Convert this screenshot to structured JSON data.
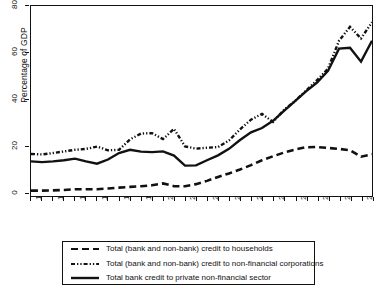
{
  "chart_data": {
    "type": "line",
    "title": "",
    "xlabel": "",
    "ylabel": "Percentage of GDP",
    "ylim": [
      0,
      80
    ],
    "yticks": [
      0,
      20,
      40,
      60,
      80
    ],
    "xlim": [
      1989,
      2020
    ],
    "grid": false,
    "legend_position": "below",
    "x": [
      1989,
      1990,
      1991,
      1992,
      1993,
      1994,
      1995,
      1996,
      1997,
      1998,
      1999,
      2000,
      2001,
      2002,
      2003,
      2004,
      2005,
      2006,
      2007,
      2008,
      2009,
      2010,
      2011,
      2012,
      2013,
      2014,
      2015,
      2016,
      2017,
      2018,
      2019,
      2020
    ],
    "xtick_labels": [
      "1989",
      "1991",
      "1993",
      "1995",
      "1997",
      "1999",
      "2001",
      "2003",
      "2005",
      "2007",
      "2009",
      "2011",
      "2013",
      "2015",
      "2017",
      "2019"
    ],
    "xtick_years": [
      1989,
      1991,
      1993,
      1995,
      1997,
      1999,
      2001,
      2003,
      2005,
      2007,
      2009,
      2011,
      2013,
      2015,
      2017,
      2019
    ],
    "series": [
      {
        "name": "Total (bank and non-bank) credit to households",
        "style": "dashed",
        "color": "#111111",
        "values": [
          0.4,
          0.4,
          0.5,
          0.7,
          1.0,
          1.0,
          1.0,
          1.3,
          1.7,
          2.0,
          2.3,
          2.7,
          3.5,
          2.3,
          2.3,
          3.2,
          4.6,
          6.3,
          7.8,
          9.5,
          11.4,
          13.5,
          15.2,
          16.8,
          18.1,
          19.1,
          19.2,
          18.8,
          18.4,
          17.8,
          15.0,
          16.1
        ]
      },
      {
        "name": "Total (bank and non-bank) credit to non-financial corporations",
        "style": "dash-dot-dotted",
        "color": "#111111",
        "values": [
          16.2,
          16.0,
          16.6,
          17.3,
          18.0,
          18.4,
          19.4,
          17.8,
          18.0,
          22.5,
          25.0,
          25.2,
          22.6,
          27.0,
          19.5,
          18.5,
          18.9,
          19.2,
          22.0,
          26.8,
          31.0,
          33.5,
          30.0,
          35.2,
          39.0,
          43.5,
          48.0,
          53.0,
          57.5,
          61.0,
          62.0,
          60.5
        ]
      },
      {
        "name": "Total bank credit to private non-financial sector",
        "style": "solid",
        "color": "#111111",
        "values": [
          13.0,
          12.7,
          13.0,
          13.5,
          14.2,
          13.0,
          12.0,
          13.8,
          16.6,
          18.0,
          17.2,
          17.0,
          17.3,
          15.5,
          11.2,
          11.3,
          13.5,
          15.6,
          18.4,
          22.2,
          25.5,
          27.4,
          30.5,
          34.8,
          39.0,
          43.2,
          47.0,
          52.0,
          56.5,
          60.0,
          60.4,
          61.5
        ]
      }
    ],
    "series_tail": {
      "corporations": {
        "2017": 65.0,
        "2018": 71.0,
        "2019": 66.0,
        "2020": 73.0
      },
      "bank_credit": {
        "2017": 61.6,
        "2018": 62.0,
        "2019": 56.0,
        "2020": 65.0
      }
    }
  },
  "legend": {
    "entries": [
      {
        "label": "Total (bank and non-bank) credit to households",
        "key": "dashed"
      },
      {
        "label": "Total (bank and non-bank) credit to non-financial corporations",
        "key": "dash-dot-dotted"
      },
      {
        "label": "Total bank credit to private non-financial sector",
        "key": "solid"
      }
    ]
  }
}
